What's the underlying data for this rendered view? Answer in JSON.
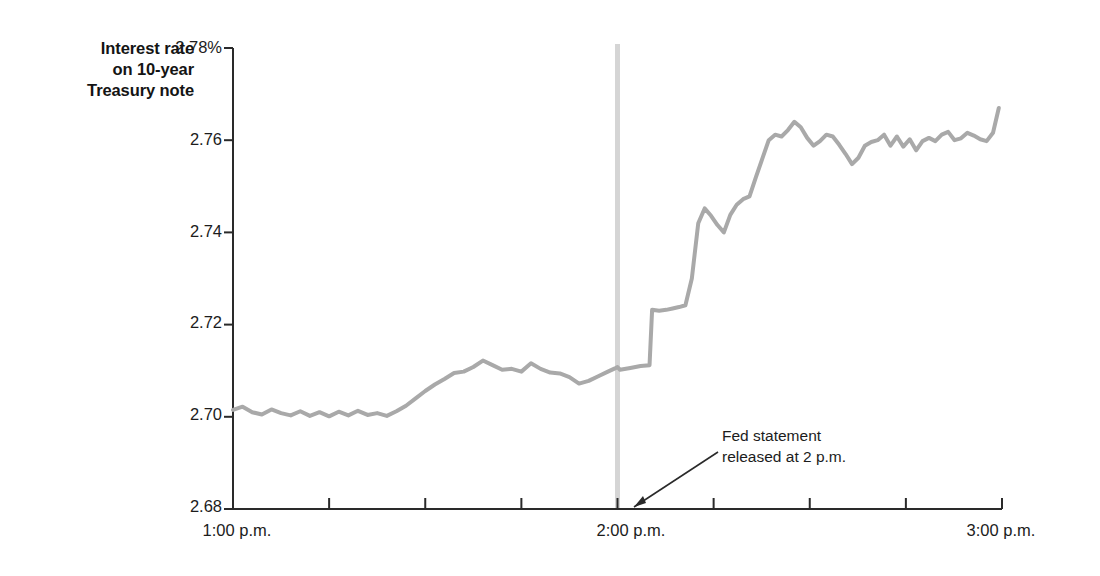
{
  "chart_data": {
    "type": "line",
    "title": "",
    "ylabel": "Interest rate on 10-year Treasury note",
    "ylabel_lines": [
      "Interest rate",
      "on 10-year",
      "Treasury note"
    ],
    "xlabel": "",
    "ylim": [
      2.68,
      2.78
    ],
    "ytick_labels": [
      "2.78%",
      "2.76",
      "2.74",
      "2.72",
      "2.70",
      "2.68"
    ],
    "ytick_values": [
      2.78,
      2.76,
      2.74,
      2.72,
      2.7,
      2.68
    ],
    "xtick_labels": [
      "1:00 p.m.",
      "2:00 p.m.",
      "3:00 p.m."
    ],
    "xtick_values": [
      0,
      60,
      120
    ],
    "xlim": [
      0,
      120
    ],
    "x_minor_tick_interval_minutes": 15,
    "grid": false,
    "legend": null,
    "line_color": "#a9a9a9",
    "line_width": 4,
    "annotations": [
      {
        "name": "fed-statement-annotation",
        "text_lines": [
          "Fed statement",
          "released at 2 p.m."
        ],
        "points_to_x": 60,
        "points_to_y": 2.68
      }
    ],
    "event_marker": {
      "name": "two-pm-marker",
      "x": 60,
      "label": "2:00 p.m.",
      "color": "#d5d5d5"
    },
    "x_unit": "minutes after 1:00 p.m.",
    "series": [
      {
        "name": "10-year Treasury note yield",
        "x": [
          0,
          1.5,
          3,
          4.5,
          6,
          7.5,
          9,
          10.5,
          12,
          13.5,
          15,
          16.5,
          18,
          19.5,
          21,
          22.5,
          24,
          25.5,
          27,
          28.5,
          30,
          31.5,
          33,
          34.5,
          36,
          37.5,
          39,
          40.5,
          42,
          43.5,
          45,
          46.5,
          48,
          49.5,
          51,
          52.5,
          54,
          55.5,
          57,
          58.5,
          59.6,
          60,
          60.4,
          62,
          63.6,
          65,
          65.4,
          66.5,
          67.6,
          68.6,
          69.6,
          70.6,
          71.6,
          72.6,
          73.6,
          74.6,
          75.6,
          76.6,
          77.6,
          78.6,
          79.6,
          80.6,
          81.6,
          82.6,
          83.6,
          84.6,
          85.6,
          86.6,
          87.6,
          88.6,
          89.6,
          90.6,
          91.6,
          92.6,
          93.6,
          94.6,
          95.6,
          96.6,
          97.6,
          98.6,
          99.6,
          100.6,
          101.6,
          102.6,
          103.6,
          104.6,
          105.6,
          106.6,
          107.6,
          108.6,
          109.6,
          110.6,
          111.6,
          112.6,
          113.6,
          114.6,
          115.6,
          116.6,
          117.6,
          118.6,
          119.5
        ],
        "y": [
          2.7015,
          2.7022,
          2.701,
          2.7005,
          2.7016,
          2.7008,
          2.7003,
          2.7012,
          2.7002,
          2.701,
          2.7001,
          2.7011,
          2.7003,
          2.7013,
          2.7004,
          2.7008,
          2.7002,
          2.7012,
          2.7024,
          2.704,
          2.7056,
          2.707,
          2.7082,
          2.7095,
          2.7098,
          2.7108,
          2.7122,
          2.7112,
          2.7102,
          2.7104,
          2.7098,
          2.7116,
          2.7104,
          2.7096,
          2.7094,
          2.7086,
          2.7072,
          2.7078,
          2.7088,
          2.7098,
          2.7105,
          2.7108,
          2.7102,
          2.7106,
          2.711,
          2.7112,
          2.7232,
          2.723,
          2.7232,
          2.7235,
          2.7238,
          2.7242,
          2.73,
          2.742,
          2.7452,
          2.7436,
          2.7416,
          2.74,
          2.7438,
          2.746,
          2.7472,
          2.7478,
          2.752,
          2.756,
          2.76,
          2.7612,
          2.7608,
          2.7622,
          2.764,
          2.7628,
          2.7605,
          2.7588,
          2.7598,
          2.7612,
          2.7608,
          2.759,
          2.757,
          2.7548,
          2.7562,
          2.7588,
          2.7596,
          2.76,
          2.7612,
          2.7588,
          2.7608,
          2.7586,
          2.7602,
          2.7578,
          2.7598,
          2.7605,
          2.7598,
          2.7612,
          2.7618,
          2.76,
          2.7604,
          2.7616,
          2.761,
          2.7602,
          2.7598,
          2.7616,
          2.767
        ]
      }
    ]
  },
  "labels": {
    "watermark_faint": ""
  }
}
